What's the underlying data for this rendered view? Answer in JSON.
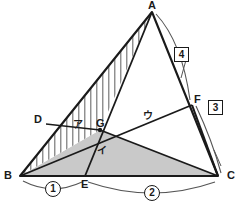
{
  "figure": {
    "colors": {
      "stroke": "#1a1a1a",
      "thin_stroke": "#4d4d4d",
      "hatch": "#6b6b6b",
      "shade_fill": "#c9c9c9",
      "arc": "#555555",
      "background": "#ffffff"
    }
  },
  "vertices": [
    {
      "name": "A",
      "label": "A",
      "x": 152,
      "y": 12
    },
    {
      "name": "B",
      "label": "B",
      "x": 20,
      "y": 176
    },
    {
      "name": "C",
      "label": "C",
      "x": 218,
      "y": 176
    },
    {
      "name": "D",
      "label": "D",
      "x": 46,
      "y": 124
    },
    {
      "name": "E",
      "label": "E",
      "x": 85,
      "y": 176
    },
    {
      "name": "F",
      "label": "F",
      "x": 192,
      "y": 105
    },
    {
      "name": "G",
      "label": "G",
      "x": 100,
      "y": 130
    }
  ],
  "vertex_labels": {
    "A": "A",
    "B": "B",
    "C": "C",
    "D": "D",
    "E": "E",
    "F": "F",
    "G": "G"
  },
  "region_labels": {
    "a": "ア",
    "i": "イ",
    "u": "ウ"
  },
  "segment_measures": {
    "be": "1",
    "ec": "2",
    "fc": "3",
    "af": "4"
  },
  "caption": {
    "text": ""
  }
}
